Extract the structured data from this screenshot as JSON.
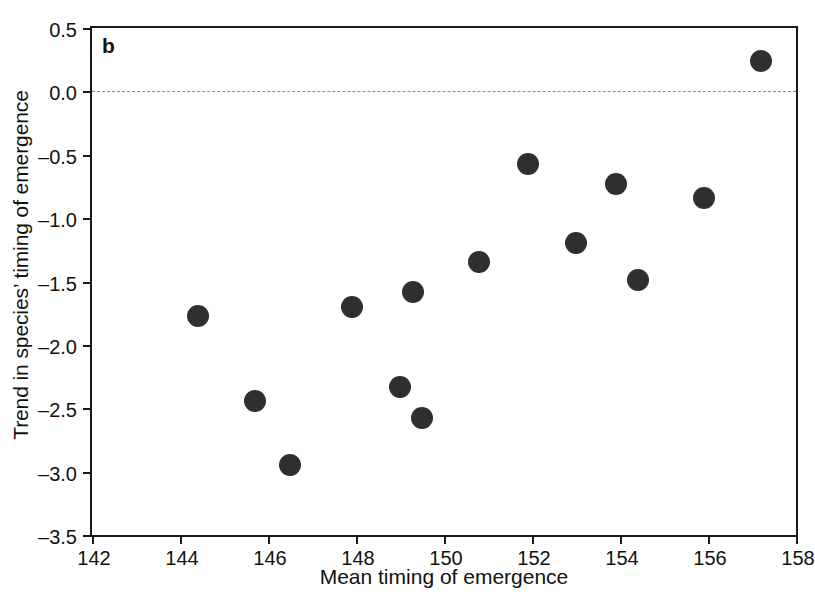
{
  "panel": {
    "letter": "b"
  },
  "chart_data": {
    "type": "scatter",
    "title": "",
    "xlabel": "Mean timing of emergence",
    "ylabel": "Trend in species’ timing of emergence",
    "xlim": [
      142,
      158
    ],
    "ylim": [
      -3.5,
      0.5
    ],
    "xticks": [
      142,
      144,
      146,
      148,
      150,
      152,
      154,
      156,
      158
    ],
    "xtick_labels": [
      "142",
      "144",
      "146",
      "148",
      "150",
      "152",
      "154",
      "156",
      "158"
    ],
    "yticks": [
      0.5,
      0.0,
      -0.5,
      -1.0,
      -1.5,
      -2.0,
      -2.5,
      -3.0,
      -3.5
    ],
    "ytick_labels": [
      "0.5",
      "0.0",
      "–0.5",
      "–1.0",
      "–1.5",
      "–2.0",
      "–2.5",
      "–3.0",
      "–3.5"
    ],
    "grid": false,
    "legend": null,
    "marker": {
      "shape": "circle",
      "color": "#302f2f",
      "size_px": 22
    },
    "reference_lines": [
      {
        "name": "zero-line",
        "orientation": "horizontal",
        "value": 0.0,
        "style": "dashed",
        "color": "#8c8c8c"
      }
    ],
    "x": [
      144.4,
      145.7,
      146.5,
      147.9,
      149.0,
      149.3,
      149.5,
      150.8,
      151.9,
      153.0,
      153.9,
      154.4,
      155.9,
      157.2
    ],
    "y": [
      -1.77,
      -2.44,
      -2.95,
      -1.7,
      -2.33,
      -1.58,
      -2.58,
      -1.35,
      -0.57,
      -1.2,
      -0.73,
      -1.49,
      -0.84,
      0.24
    ],
    "points": [
      {
        "x": 144.4,
        "y": -1.77
      },
      {
        "x": 145.7,
        "y": -2.44
      },
      {
        "x": 146.5,
        "y": -2.95
      },
      {
        "x": 147.9,
        "y": -1.7
      },
      {
        "x": 149.0,
        "y": -2.33
      },
      {
        "x": 149.3,
        "y": -1.58
      },
      {
        "x": 149.5,
        "y": -2.58
      },
      {
        "x": 150.8,
        "y": -1.35
      },
      {
        "x": 151.9,
        "y": -0.57
      },
      {
        "x": 153.0,
        "y": -1.2
      },
      {
        "x": 153.9,
        "y": -0.73
      },
      {
        "x": 154.4,
        "y": -1.49
      },
      {
        "x": 155.9,
        "y": -0.84
      },
      {
        "x": 157.2,
        "y": 0.24
      }
    ]
  }
}
